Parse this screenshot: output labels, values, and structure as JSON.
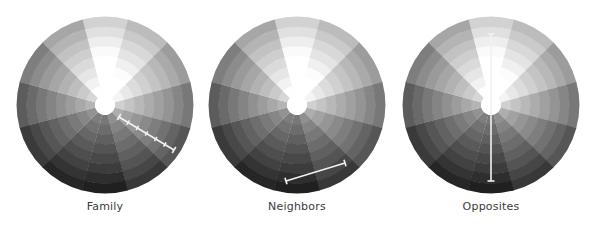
{
  "diagram": {
    "background": "#ffffff",
    "sectors": 12,
    "rings": 8,
    "outer_radius": 88,
    "hole_radius": 10,
    "hole_color": "#ffffff",
    "sector_base_gray": [
      236,
      214,
      182,
      146,
      112,
      82,
      58,
      64,
      84,
      118,
      152,
      192
    ],
    "ring_offsets": [
      62,
      50,
      38,
      26,
      14,
      2,
      -12,
      -26
    ],
    "marker_color": "#f2f2f2",
    "marker_width": 1.6
  },
  "wheels": [
    {
      "id": "family",
      "label": "Family",
      "cx": 105,
      "cy": 105,
      "marker": {
        "type": "ticked-line",
        "x1": 119,
        "y1": 117,
        "x2": 174,
        "y2": 150,
        "ticks": 6
      }
    },
    {
      "id": "neighbors",
      "label": "Neighbors",
      "cx": 297,
      "cy": 105,
      "marker": {
        "type": "capped-line",
        "x1": 286,
        "y1": 181,
        "x2": 345,
        "y2": 163
      }
    },
    {
      "id": "opposites",
      "label": "Opposites",
      "cx": 491,
      "cy": 105,
      "marker": {
        "type": "capped-line",
        "x1": 491,
        "y1": 34,
        "x2": 491,
        "y2": 181
      }
    }
  ]
}
